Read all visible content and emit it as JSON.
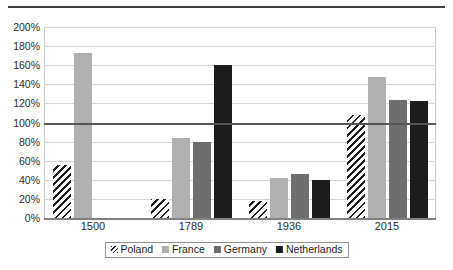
{
  "chart_data": {
    "type": "bar",
    "title": "",
    "subtitle": "",
    "xlabel": "",
    "ylabel": "",
    "categories": [
      "1500",
      "1789",
      "1936",
      "2015"
    ],
    "series": [
      {
        "name": "Poland",
        "color": "#1c1c1c",
        "fill": "diagonal-hatch",
        "values": [
          55,
          20,
          18,
          108
        ]
      },
      {
        "name": "France",
        "color": "#b0b0b0",
        "fill": "solid",
        "values": [
          173,
          84,
          42,
          148
        ]
      },
      {
        "name": "Germany",
        "color": "#6e6e6e",
        "fill": "solid",
        "values": [
          null,
          80,
          46,
          124
        ]
      },
      {
        "name": "Netherlands",
        "color": "#1c1c1c",
        "fill": "solid",
        "values": [
          null,
          160,
          40,
          123
        ]
      }
    ],
    "ylim": [
      0,
      200
    ],
    "ytick_step": 20,
    "yticks": [
      "200%",
      "180%",
      "160%",
      "140%",
      "120%",
      "100%",
      "80%",
      "60%",
      "40%",
      "20%",
      "0%"
    ],
    "ytick_values": [
      200,
      180,
      160,
      140,
      120,
      100,
      80,
      60,
      40,
      20,
      0
    ],
    "grid": true,
    "emphasis_line": 100,
    "legend_position": "bottom"
  },
  "legend": {
    "items": [
      {
        "label": "Poland"
      },
      {
        "label": "France"
      },
      {
        "label": "Germany"
      },
      {
        "label": "Netherlands"
      }
    ]
  }
}
